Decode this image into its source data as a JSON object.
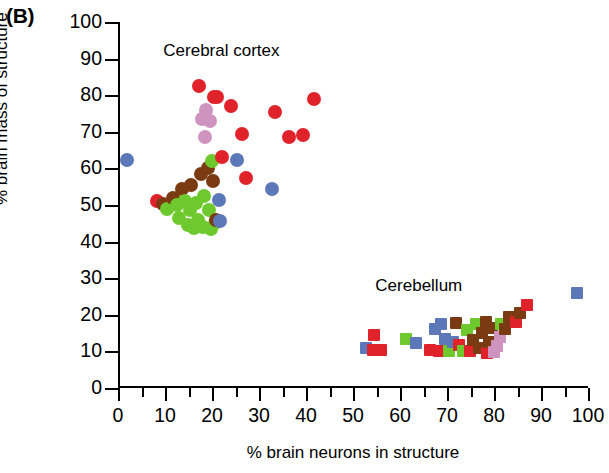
{
  "panel": {
    "label": "(B)"
  },
  "chart_data": {
    "type": "scatter",
    "title": "",
    "xlabel": "% brain neurons in structure",
    "ylabel": "% brain mass of structure",
    "xlim": [
      0,
      100
    ],
    "ylim": [
      0,
      100
    ],
    "xticks": [
      0,
      10,
      20,
      30,
      40,
      50,
      60,
      70,
      80,
      90,
      100
    ],
    "yticks": [
      0,
      10,
      20,
      30,
      40,
      50,
      60,
      70,
      80,
      90,
      100
    ],
    "xminor_step": 5,
    "grid": false,
    "legend": "none",
    "annotations": [
      {
        "text": "Cerebral cortex",
        "x": 22,
        "y": 92
      },
      {
        "text": "Cerebellum",
        "x": 64,
        "y": 28
      }
    ],
    "colors": {
      "red": "#e0232a",
      "brown": "#7b3b12",
      "green": "#6ec92e",
      "blue": "#5c78b8",
      "plum": "#cf93bf"
    },
    "marker_shapes": {
      "cerebral_cortex": "circle",
      "cerebellum": "square"
    },
    "series": [
      {
        "name": "Cerebral cortex",
        "shape": "circle",
        "points": [
          {
            "x": 2.0,
            "y": 62.2,
            "color": "blue"
          },
          {
            "x": 8.3,
            "y": 51.0,
            "color": "red"
          },
          {
            "x": 9.5,
            "y": 50.4,
            "color": "brown"
          },
          {
            "x": 10.5,
            "y": 49.0,
            "color": "green"
          },
          {
            "x": 11.8,
            "y": 52.0,
            "color": "brown"
          },
          {
            "x": 12.5,
            "y": 50.0,
            "color": "green"
          },
          {
            "x": 13.0,
            "y": 46.5,
            "color": "green"
          },
          {
            "x": 13.6,
            "y": 54.5,
            "color": "brown"
          },
          {
            "x": 14.3,
            "y": 51.0,
            "color": "green"
          },
          {
            "x": 14.8,
            "y": 44.5,
            "color": "green"
          },
          {
            "x": 15.4,
            "y": 48.5,
            "color": "green"
          },
          {
            "x": 15.5,
            "y": 55.5,
            "color": "brown"
          },
          {
            "x": 16.2,
            "y": 43.8,
            "color": "green"
          },
          {
            "x": 16.6,
            "y": 50.5,
            "color": "green"
          },
          {
            "x": 17.0,
            "y": 46.0,
            "color": "green"
          },
          {
            "x": 17.3,
            "y": 82.4,
            "color": "red"
          },
          {
            "x": 17.6,
            "y": 58.5,
            "color": "brown"
          },
          {
            "x": 17.8,
            "y": 73.5,
            "color": "plum"
          },
          {
            "x": 18.0,
            "y": 44.0,
            "color": "green"
          },
          {
            "x": 18.3,
            "y": 52.5,
            "color": "green"
          },
          {
            "x": 18.5,
            "y": 68.5,
            "color": "plum"
          },
          {
            "x": 18.8,
            "y": 76.0,
            "color": "plum"
          },
          {
            "x": 19.2,
            "y": 60.0,
            "color": "brown"
          },
          {
            "x": 19.4,
            "y": 48.5,
            "color": "green"
          },
          {
            "x": 19.6,
            "y": 73.0,
            "color": "plum"
          },
          {
            "x": 19.8,
            "y": 43.5,
            "color": "green"
          },
          {
            "x": 20.0,
            "y": 62.0,
            "color": "green"
          },
          {
            "x": 20.2,
            "y": 56.5,
            "color": "brown"
          },
          {
            "x": 20.4,
            "y": 79.5,
            "color": "red"
          },
          {
            "x": 20.6,
            "y": 45.0,
            "color": "green"
          },
          {
            "x": 20.9,
            "y": 46.0,
            "color": "brown"
          },
          {
            "x": 21.1,
            "y": 79.6,
            "color": "red"
          },
          {
            "x": 21.4,
            "y": 51.5,
            "color": "blue"
          },
          {
            "x": 21.6,
            "y": 45.5,
            "color": "blue"
          },
          {
            "x": 22.2,
            "y": 63.0,
            "color": "red"
          },
          {
            "x": 24.0,
            "y": 77.0,
            "color": "red"
          },
          {
            "x": 25.4,
            "y": 62.3,
            "color": "blue"
          },
          {
            "x": 26.4,
            "y": 69.5,
            "color": "red"
          },
          {
            "x": 27.3,
            "y": 57.5,
            "color": "red"
          },
          {
            "x": 32.8,
            "y": 54.3,
            "color": "blue"
          },
          {
            "x": 33.4,
            "y": 75.5,
            "color": "red"
          },
          {
            "x": 36.3,
            "y": 68.5,
            "color": "red"
          },
          {
            "x": 39.3,
            "y": 69.0,
            "color": "red"
          },
          {
            "x": 41.6,
            "y": 79.0,
            "color": "red"
          }
        ]
      },
      {
        "name": "Cerebellum",
        "shape": "square",
        "points": [
          {
            "x": 52.8,
            "y": 11.0,
            "color": "blue"
          },
          {
            "x": 54.3,
            "y": 10.3,
            "color": "red"
          },
          {
            "x": 54.5,
            "y": 14.5,
            "color": "red"
          },
          {
            "x": 56.0,
            "y": 10.3,
            "color": "red"
          },
          {
            "x": 61.3,
            "y": 13.5,
            "color": "green"
          },
          {
            "x": 63.5,
            "y": 12.3,
            "color": "blue"
          },
          {
            "x": 66.3,
            "y": 10.5,
            "color": "red"
          },
          {
            "x": 67.5,
            "y": 16.0,
            "color": "blue"
          },
          {
            "x": 68.3,
            "y": 10.0,
            "color": "red"
          },
          {
            "x": 68.8,
            "y": 17.5,
            "color": "blue"
          },
          {
            "x": 69.5,
            "y": 13.3,
            "color": "blue"
          },
          {
            "x": 70.5,
            "y": 10.2,
            "color": "green"
          },
          {
            "x": 71.2,
            "y": 12.6,
            "color": "blue"
          },
          {
            "x": 72.0,
            "y": 17.8,
            "color": "brown"
          },
          {
            "x": 72.6,
            "y": 11.8,
            "color": "red"
          },
          {
            "x": 73.4,
            "y": 10.2,
            "color": "green"
          },
          {
            "x": 74.2,
            "y": 15.8,
            "color": "green"
          },
          {
            "x": 74.8,
            "y": 10.0,
            "color": "red"
          },
          {
            "x": 75.6,
            "y": 13.0,
            "color": "brown"
          },
          {
            "x": 76.2,
            "y": 17.4,
            "color": "green"
          },
          {
            "x": 76.8,
            "y": 11.0,
            "color": "brown"
          },
          {
            "x": 77.5,
            "y": 15.0,
            "color": "brown"
          },
          {
            "x": 78.2,
            "y": 18.0,
            "color": "brown"
          },
          {
            "x": 78.5,
            "y": 9.5,
            "color": "red"
          },
          {
            "x": 79.0,
            "y": 12.5,
            "color": "brown"
          },
          {
            "x": 79.6,
            "y": 16.5,
            "color": "brown"
          },
          {
            "x": 80.0,
            "y": 9.8,
            "color": "plum"
          },
          {
            "x": 80.6,
            "y": 11.5,
            "color": "plum"
          },
          {
            "x": 81.2,
            "y": 14.0,
            "color": "plum"
          },
          {
            "x": 81.5,
            "y": 17.5,
            "color": "green"
          },
          {
            "x": 82.4,
            "y": 16.0,
            "color": "brown"
          },
          {
            "x": 83.2,
            "y": 19.3,
            "color": "brown"
          },
          {
            "x": 84.6,
            "y": 18.0,
            "color": "red"
          },
          {
            "x": 85.6,
            "y": 20.5,
            "color": "brown"
          },
          {
            "x": 87.0,
            "y": 22.6,
            "color": "red"
          },
          {
            "x": 97.6,
            "y": 26.0,
            "color": "blue"
          }
        ]
      }
    ]
  }
}
